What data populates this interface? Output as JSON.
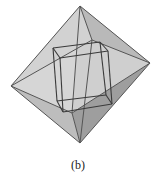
{
  "caption": "(b)",
  "diagram": {
    "octahedron": {
      "vertices": {
        "top": [
          80,
          6
        ],
        "bottom": [
          80,
          143
        ],
        "left": [
          11,
          86
        ],
        "right": [
          150,
          63
        ],
        "front": [
          72,
          113
        ],
        "back": [
          92,
          40
        ]
      },
      "faces": [
        {
          "pts": [
            "top",
            "left",
            "front"
          ],
          "fill": "#d6d6d6"
        },
        {
          "pts": [
            "top",
            "front",
            "right"
          ],
          "fill": "#cfcfcf"
        },
        {
          "pts": [
            "top",
            "right",
            "back"
          ],
          "fill": "#b9b9b9"
        },
        {
          "pts": [
            "top",
            "back",
            "left"
          ],
          "fill": "#d2d2d2"
        },
        {
          "pts": [
            "bottom",
            "left",
            "front"
          ],
          "fill": "#bdbdbd"
        },
        {
          "pts": [
            "bottom",
            "front",
            "right"
          ],
          "fill": "#9e9e9e"
        }
      ],
      "edge_color": "#555555"
    },
    "cube": {
      "vertices": {
        "a": [
          53,
          48
        ],
        "b": [
          100,
          42
        ],
        "c": [
          106,
          95
        ],
        "d": [
          57,
          101
        ],
        "e": [
          60,
          58
        ],
        "f": [
          108,
          51
        ],
        "g": [
          112,
          104
        ],
        "h": [
          63,
          112
        ]
      },
      "edges": [
        [
          "a",
          "b"
        ],
        [
          "b",
          "c"
        ],
        [
          "c",
          "d"
        ],
        [
          "d",
          "a"
        ],
        [
          "e",
          "f"
        ],
        [
          "f",
          "g"
        ],
        [
          "g",
          "h"
        ],
        [
          "h",
          "e"
        ],
        [
          "a",
          "e"
        ],
        [
          "b",
          "f"
        ],
        [
          "c",
          "g"
        ],
        [
          "d",
          "h"
        ]
      ],
      "edge_color": "#3a3a3a"
    }
  }
}
